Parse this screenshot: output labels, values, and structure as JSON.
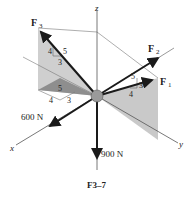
{
  "figure": {
    "caption": "F3–7",
    "axes": {
      "x": "x",
      "y": "y",
      "z": "z"
    },
    "forces": {
      "F1": {
        "label": "F",
        "sub": "1",
        "slope": {
          "hyp": "5",
          "vert": "3",
          "horiz": "4"
        }
      },
      "F2": {
        "label": "F",
        "sub": "2"
      },
      "F3": {
        "label": "F",
        "sub": "3",
        "slope": {
          "hyp": "5",
          "vert": "4",
          "horiz": "3"
        },
        "base_slope": {
          "hyp": "5",
          "a": "4",
          "b": "3"
        }
      },
      "F4": {
        "label": "600 N"
      },
      "F5": {
        "label": "900 N"
      }
    },
    "colors": {
      "plane": "#c8c8c8",
      "plane_dark": "#8a8a8a",
      "arrow": "#1a1a1a",
      "axis": "#555555",
      "ball": "#9a9a9a"
    }
  }
}
